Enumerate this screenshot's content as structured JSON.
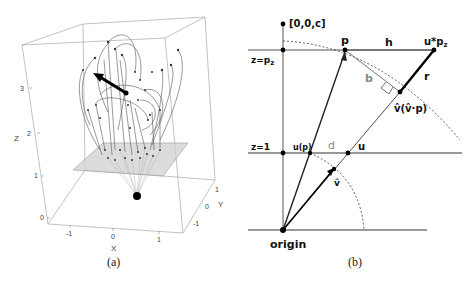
{
  "panel_a": {
    "caption": "(a)",
    "axes": {
      "x": {
        "name": "X",
        "ticks": [
          "-1",
          "0",
          "1"
        ]
      },
      "y": {
        "name": "Y",
        "ticks": [
          "1",
          "0",
          "-1"
        ]
      },
      "z": {
        "name": "Z",
        "ticks": [
          "0",
          "1",
          "2",
          "3"
        ]
      }
    },
    "description": "3D view of curved trajectories (arcs with point markers) around a central black arrow, above a grey translucent plane; rays converge to a black origin sphere below the plane"
  },
  "panel_b": {
    "caption": "(b)",
    "labels": {
      "top_point": "[0,0,c]",
      "z_pz": "z=p",
      "z_pz_sub": "z",
      "z_one": "z=1",
      "p": "p",
      "h": "h",
      "u_pz": "u*p",
      "u_pz_sub": "z",
      "b": "b",
      "r": "r",
      "projection": "v̂(v̂·p)",
      "u_of_p": "u(p)",
      "d": "d",
      "u": "u",
      "v_hat": "v̂",
      "origin": "origin"
    }
  }
}
